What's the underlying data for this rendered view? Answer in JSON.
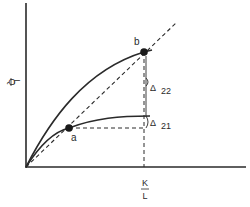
{
  "diagram": {
    "axes": {
      "y_label_num": "Q",
      "y_label_den": "L",
      "x_label_num": "K",
      "x_label_den": "L"
    },
    "points": {
      "a": "a",
      "b": "b"
    },
    "annotations": {
      "delta_22_symbol": "Δ",
      "delta_22_sub": "22",
      "delta_21_symbol": "Δ",
      "delta_21_sub": "21"
    },
    "colors": {
      "line": "#2a2a2a",
      "background": "#ffffff"
    }
  }
}
